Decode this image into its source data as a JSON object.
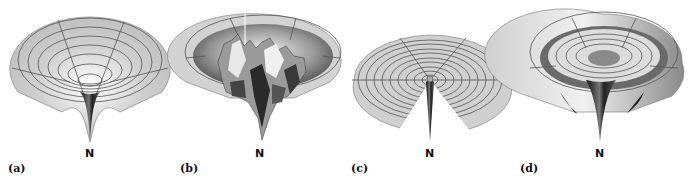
{
  "figure": {
    "panels": [
      {
        "id": "a",
        "label": "(a)",
        "point_label": "N",
        "description": "smooth funnel surface with single deep minimum"
      },
      {
        "id": "b",
        "label": "(b)",
        "point_label": "N",
        "description": "rugged funnel surface with many local minima"
      },
      {
        "id": "c",
        "label": "(c)",
        "point_label": "N",
        "description": "flat golf-course surface with narrow well"
      },
      {
        "id": "d",
        "label": "(d)",
        "point_label": "N",
        "description": "funnel with moat surrounding central well"
      }
    ]
  },
  "colors": {
    "surface_light": "#e6e6e6",
    "surface_mid": "#bdbdbd",
    "surface_dark": "#2a2a2a",
    "grid": "#555555",
    "text": "#111111"
  }
}
